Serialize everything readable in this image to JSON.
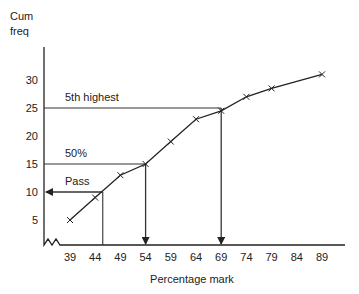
{
  "chart_data": {
    "type": "line",
    "title": "",
    "xlabel": "Percentage mark",
    "ylabel": "Cum freq",
    "ylabel_lines": [
      "Cum",
      "freq"
    ],
    "x_ticks": [
      39,
      44,
      49,
      54,
      59,
      64,
      69,
      74,
      79,
      84,
      89
    ],
    "y_ticks": [
      5,
      10,
      15,
      20,
      25,
      30
    ],
    "x": [
      39,
      44,
      49,
      54,
      59,
      64,
      69,
      74,
      79,
      89
    ],
    "values": [
      5,
      9,
      13,
      15,
      19,
      23,
      24.5,
      27,
      28.5,
      31
    ],
    "marker": "x",
    "grid": false,
    "axis_break": true,
    "annotations": [
      {
        "label": "5th highest",
        "y": 25,
        "x": 69,
        "direction": "down"
      },
      {
        "label": "50%",
        "y": 15,
        "x": 54,
        "direction": "down"
      },
      {
        "label": "Pass",
        "y": 10,
        "x": 45.5,
        "direction": "left"
      }
    ],
    "colors": {
      "line": "#222222",
      "axis": "#222222",
      "guides": "#333333"
    }
  }
}
